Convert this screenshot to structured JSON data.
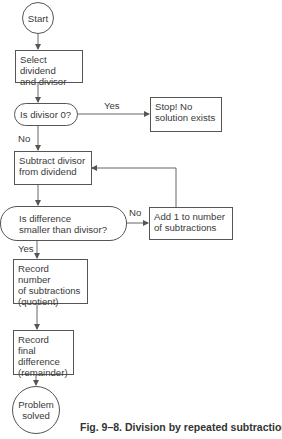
{
  "figure": {
    "caption": "Fig. 9–8. Division by repeated subtraction."
  },
  "nodes": {
    "start": {
      "text": "Start",
      "shape": "circle"
    },
    "select": {
      "lines": [
        "Select dividend",
        "and divisor"
      ],
      "shape": "rect"
    },
    "is_zero": {
      "text": "Is divisor 0?",
      "shape": "decision-pill"
    },
    "stop": {
      "lines": [
        "Stop! No",
        "solution exists"
      ],
      "shape": "rect"
    },
    "subtract": {
      "lines": [
        "Subtract divisor",
        "from dividend"
      ],
      "shape": "rect"
    },
    "is_smaller": {
      "lines": [
        "Is difference",
        "smaller than divisor?"
      ],
      "shape": "decision-pill"
    },
    "add_one": {
      "lines": [
        "Add 1 to number",
        "of subtractions"
      ],
      "shape": "rect"
    },
    "record_quotient": {
      "lines": [
        "Record number",
        "of subtractions",
        "(quotient)"
      ],
      "shape": "rect"
    },
    "record_remainder": {
      "lines": [
        "Record final",
        "difference",
        "(remainder)"
      ],
      "shape": "rect"
    },
    "end": {
      "lines": [
        "Problem",
        "solved"
      ],
      "shape": "circle"
    }
  },
  "edge_labels": {
    "zero_yes": "Yes",
    "zero_no": "No",
    "smaller_no": "No",
    "smaller_yes": "Yes"
  },
  "colors": {
    "line": "#555555",
    "text": "#3a3a3a",
    "background": "#ffffff"
  }
}
